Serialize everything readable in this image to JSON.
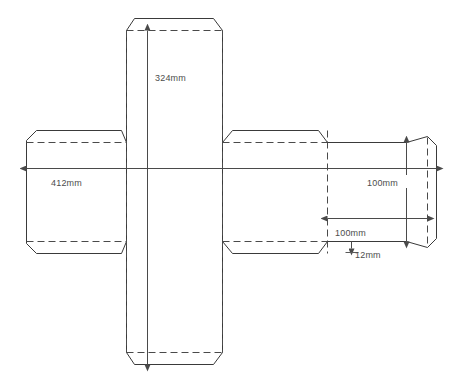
{
  "drawing": {
    "title": "Carton dieline layout",
    "type": "packaging-dieline",
    "units": "mm",
    "background_color": "#ffffff",
    "line_color": "#3a3a3a",
    "text_color": "#4c4c4c"
  },
  "dimensions": [
    {
      "id": "height-324",
      "label": "324mm",
      "value": 324,
      "unit": "mm",
      "orientation": "vertical",
      "description": "overall vertical length of centre panel column"
    },
    {
      "id": "width-412",
      "label": "412mm",
      "value": 412,
      "unit": "mm",
      "orientation": "horizontal",
      "description": "overall horizontal length across main panel row"
    },
    {
      "id": "depth-100-vertical",
      "label": "100mm",
      "value": 100,
      "unit": "mm",
      "orientation": "vertical",
      "description": "panel depth measured on right side panel"
    },
    {
      "id": "depth-100-horizontal",
      "label": "100mm",
      "value": 100,
      "unit": "mm",
      "orientation": "horizontal",
      "description": "panel depth measured across right side panel"
    },
    {
      "id": "glue-12",
      "label": "12mm",
      "value": 12,
      "unit": "mm",
      "orientation": "vertical",
      "description": "glue flap / tab thickness"
    }
  ],
  "line_styles": {
    "cut_label": "cut line",
    "crease_label": "crease / fold line",
    "dimension_label": "dimension line"
  }
}
